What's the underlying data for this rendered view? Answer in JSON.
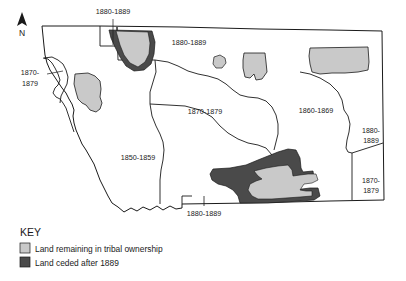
{
  "figure": {
    "type": "thematic-map",
    "background_color": "#ffffff",
    "outline_color": "#1a1a1a"
  },
  "compass": {
    "name": "north-arrow",
    "letter": "N"
  },
  "region_labels": [
    {
      "id": "r1",
      "text": "1880-1889",
      "x": 113,
      "y": 16,
      "anchor": "middle",
      "lines": [
        "1880-1889"
      ]
    },
    {
      "id": "r2",
      "text": "1880-1889",
      "x": 189,
      "y": 45,
      "anchor": "middle",
      "lines": [
        "1880-1889"
      ]
    },
    {
      "id": "r3",
      "text": "1870-1879",
      "x": 30,
      "y": 77,
      "anchor": "middle",
      "lines": [
        "1870-",
        "1879"
      ]
    },
    {
      "id": "r4",
      "text": "1870-1879",
      "x": 205,
      "y": 112,
      "anchor": "middle",
      "lines": [
        "1870-1879"
      ]
    },
    {
      "id": "r5",
      "text": "1860-1869",
      "x": 316,
      "y": 112,
      "anchor": "middle",
      "lines": [
        "1860-1869"
      ]
    },
    {
      "id": "r6",
      "text": "1850-1859",
      "x": 138,
      "y": 158,
      "anchor": "middle",
      "lines": [
        "1850-1859"
      ]
    },
    {
      "id": "r7",
      "text": "1880-1889",
      "x": 371,
      "y": 134,
      "anchor": "middle",
      "lines": [
        "1880-",
        "1889"
      ]
    },
    {
      "id": "r8",
      "text": "1870-1879",
      "x": 371,
      "y": 184,
      "anchor": "middle",
      "lines": [
        "1870-",
        "1879"
      ]
    },
    {
      "id": "r9",
      "text": "1880-1889",
      "x": 204,
      "y": 216,
      "anchor": "middle",
      "lines": [
        "1880-1889"
      ]
    }
  ],
  "key": {
    "title": "KEY",
    "entries": [
      {
        "label": "Land remaining in tribal ownership",
        "color": "#c9c9c9",
        "swatch_name": "tribal-ownership-swatch"
      },
      {
        "label": "Land ceded after 1889",
        "color": "#4a4a4a",
        "swatch_name": "ceded-land-swatch"
      }
    ]
  },
  "map_data": {
    "colors": {
      "remaining": "#c9c9c9",
      "ceded": "#4a4a4a",
      "state_fill": "#ffffff",
      "border": "#1a1a1a"
    },
    "reservations": [
      {
        "name": "northwest-reservation",
        "status": "remaining-with-ceded",
        "position": "north-west"
      },
      {
        "name": "west-central-reservation",
        "status": "remaining",
        "position": "west"
      },
      {
        "name": "small-oval-reservation",
        "status": "remaining",
        "position": "north-central"
      },
      {
        "name": "north-central-reservation",
        "status": "remaining",
        "position": "north-central"
      },
      {
        "name": "northeast-reservation",
        "status": "remaining",
        "position": "north-east"
      },
      {
        "name": "southeast-reservation",
        "status": "remaining-with-ceded",
        "position": "south-east"
      }
    ]
  }
}
